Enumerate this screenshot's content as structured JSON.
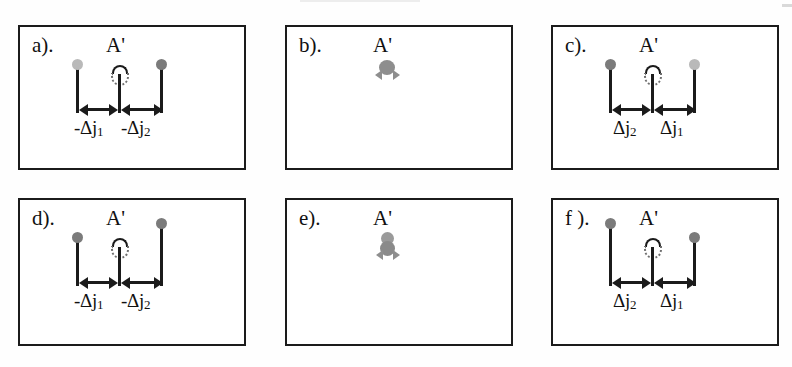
{
  "figure": {
    "panel_count": 6,
    "columns": 3,
    "rows": 2,
    "center_symbol": "A'",
    "colors": {
      "border": "#1b1b1b",
      "ink": "#111111",
      "ball_light": "#b9b9b9",
      "ball_dark": "#7b7b7b",
      "ball_mid": "#8e8e8e",
      "background": "#ffffff"
    }
  },
  "panels": [
    {
      "tag": "a).",
      "reference_label": "A'",
      "state": "separated",
      "left_ball": "light",
      "right_ball": "dark",
      "left_ball_raised": false,
      "right_ball_raised": false,
      "measures": [
        {
          "label_text": "-Δj",
          "label_sub": "1",
          "side": "left"
        },
        {
          "label_text": "-Δj",
          "label_sub": "2",
          "side": "right"
        }
      ],
      "label_gap": false
    },
    {
      "tag": "b).",
      "reference_label": "A'",
      "state": "collapsed",
      "cluster": "single",
      "measures": [],
      "label_gap": false
    },
    {
      "tag": "c).",
      "reference_label": "A'",
      "state": "separated",
      "left_ball": "dark",
      "right_ball": "light",
      "left_ball_raised": false,
      "right_ball_raised": false,
      "measures": [
        {
          "label_text": "Δj",
          "label_sub": "2",
          "side": "left"
        },
        {
          "label_text": "Δj",
          "label_sub": "1",
          "side": "right"
        }
      ],
      "label_gap": true
    },
    {
      "tag": "d).",
      "reference_label": "A'",
      "state": "separated",
      "left_ball": "dark",
      "right_ball": "dark",
      "left_ball_raised": false,
      "right_ball_raised": true,
      "measures": [
        {
          "label_text": "-Δj",
          "label_sub": "1",
          "side": "left"
        },
        {
          "label_text": "-Δj",
          "label_sub": "2",
          "side": "right"
        }
      ],
      "label_gap": false
    },
    {
      "tag": "e).",
      "reference_label": "A'",
      "state": "collapsed",
      "cluster": "stacked",
      "measures": [],
      "label_gap": false
    },
    {
      "tag": "f ).",
      "reference_label": "A'",
      "state": "separated",
      "left_ball": "dark",
      "right_ball": "dark",
      "left_ball_raised": true,
      "right_ball_raised": false,
      "measures": [
        {
          "label_text": "Δj",
          "label_sub": "2",
          "side": "left"
        },
        {
          "label_text": "Δj",
          "label_sub": "1",
          "side": "right"
        }
      ],
      "label_gap": true
    }
  ]
}
